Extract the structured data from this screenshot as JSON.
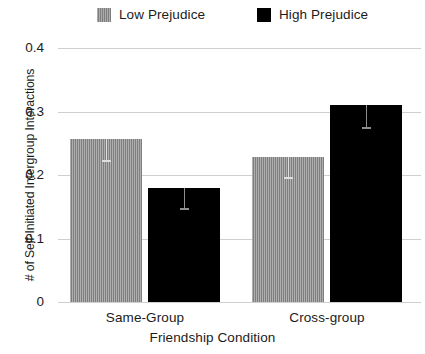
{
  "chart_data": {
    "type": "bar",
    "title": "",
    "xlabel": "Friendship Condition",
    "ylabel": "# of Self-Initiated Intergroup Interactions",
    "categories": [
      "Same-Group",
      "Cross-group"
    ],
    "series": [
      {
        "name": "Low Prejudice",
        "color": "#8c8c8c",
        "values": [
          0.256,
          0.229
        ],
        "errors_low": [
          0.033,
          0.032
        ],
        "errors_high": [
          0.0,
          0.0
        ]
      },
      {
        "name": "High Prejudice",
        "color": "#000000",
        "values": [
          0.179,
          0.311
        ],
        "errors_low": [
          0.031,
          0.035
        ],
        "errors_high": [
          0.0,
          0.0
        ]
      }
    ],
    "ylim": [
      0,
      0.4
    ],
    "yticks": [
      0,
      0.1,
      0.2,
      0.3,
      0.4
    ],
    "ytick_labels": [
      "0",
      "0.1",
      "0.2",
      "0.3",
      "0.4"
    ],
    "grid": true,
    "legend_position": "top"
  },
  "legend": {
    "entries": [
      {
        "label": "Low Prejudice",
        "swatch": "gray-hatched-swatch"
      },
      {
        "label": "High Prejudice",
        "swatch": "black-swatch"
      }
    ]
  },
  "axes": {
    "y_title": "# of Self-Initiated Intergroup Interactions",
    "x_title": "Friendship Condition",
    "y_ticks": [
      "0.4",
      "0.3",
      "0.2",
      "0.1",
      "0"
    ],
    "x_ticks": [
      "Same-Group",
      "Cross-group"
    ]
  }
}
